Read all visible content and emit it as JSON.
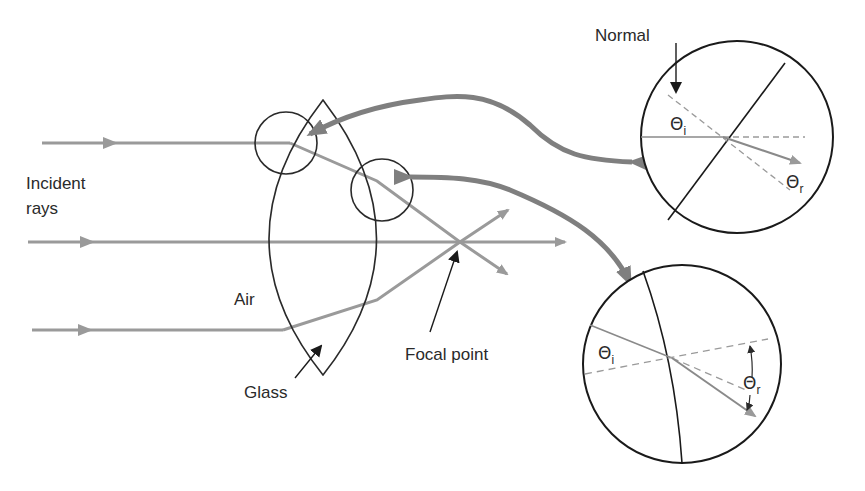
{
  "diagram": {
    "labels": {
      "incident_line1": "Incident",
      "incident_line2": "rays",
      "air": "Air",
      "glass": "Glass",
      "focal_point": "Focal point",
      "normal": "Normal"
    },
    "angles": {
      "theta": "Θ",
      "incident_sub": "i",
      "refracted_sub": "r"
    },
    "colors": {
      "ray": "#9a9a9a",
      "outline": "#2a2a2a",
      "callout_arrow": "#7f7f7f",
      "background": "#ffffff"
    },
    "elements": {
      "incident_rays": 3,
      "lens": "biconvex glass lens",
      "detail_circles": 2,
      "magnified_insets": 2
    }
  }
}
